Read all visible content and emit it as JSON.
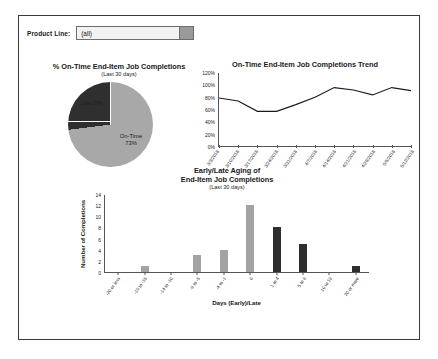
{
  "filter": {
    "label": "Product Line:",
    "value": "(all)",
    "arrow_icon": "dropdown-arrow-icon"
  },
  "pie": {
    "title": "% On-Time End-Item Job Completions",
    "subtitle": "(Last 30 days)",
    "ontime_label_line1": "On-Time",
    "ontime_label_line2": "73%",
    "late_label": "Late 27%"
  },
  "trend": {
    "title": "On-Time End-Item Job Completions Trend"
  },
  "aging": {
    "title_line1": "Early/Late Aging of",
    "title_line2": "End-Item Job Completions",
    "subtitle": "(Last 30 days)",
    "ylabel": "Number of Completions",
    "xlabel": "Days (Early)/Late"
  },
  "colors": {
    "pie_ontime": "#a8a8a8",
    "pie_late": "#2f2f2f",
    "bar_early": "#a3a3a3",
    "bar_late": "#2e2e2e",
    "line": "#1a1a1a",
    "axis": "#555555",
    "frame": "#3a3a3a"
  },
  "chart_data": [
    {
      "type": "pie",
      "title": "% On-Time End-Item Job Completions",
      "subtitle": "(Last 30 days)",
      "labels": [
        "On-Time",
        "Late"
      ],
      "values": [
        73,
        27
      ],
      "data_labels": [
        "On-Time 73%",
        "Late 27%"
      ],
      "colors": [
        "#a8a8a8",
        "#2f2f2f"
      ],
      "legend": "none",
      "start_angle_deg": 0
    },
    {
      "type": "line",
      "title": "On-Time End-Item Job Completions Trend",
      "xlabel": "",
      "ylabel": "",
      "x": [
        "3/3/2018",
        "3/10/2018",
        "3/17/2018",
        "3/24/2018",
        "3/31/2018",
        "4/7/2018",
        "4/14/2018",
        "4/21/2018",
        "4/28/2018",
        "5/5/2018",
        "5/12/2018"
      ],
      "values": [
        79,
        74,
        57,
        57,
        68,
        80,
        96,
        92,
        84,
        96,
        91
      ],
      "unit": "%",
      "ylim": [
        0,
        120
      ],
      "yticks": [
        0,
        20,
        40,
        60,
        80,
        100,
        120
      ],
      "ytick_labels": [
        "0%",
        "20%",
        "40%",
        "60%",
        "80%",
        "100%",
        "120%"
      ],
      "grid": false,
      "legend": "none",
      "series_color": "#1a1a1a"
    },
    {
      "type": "bar",
      "title": "Early/Late Aging of End-Item Job Completions",
      "subtitle": "(Last 30 days)",
      "xlabel": "Days (Early)/Late",
      "ylabel": "Number of Completions",
      "categories": [
        "-20 or less",
        "-19 to -15",
        "-14 to -10",
        "-9 to -5",
        "-4 to -1",
        "0",
        "1 to 4",
        "5 to 9",
        "10 to 19",
        "20 or more"
      ],
      "values": [
        0,
        1,
        0,
        3,
        4,
        12,
        8,
        5,
        0,
        1
      ],
      "bar_colors": [
        "#a3a3a3",
        "#a3a3a3",
        "#a3a3a3",
        "#a3a3a3",
        "#a3a3a3",
        "#a3a3a3",
        "#2e2e2e",
        "#2e2e2e",
        "#2e2e2e",
        "#2e2e2e"
      ],
      "ylim": [
        0,
        14
      ],
      "yticks": [
        0,
        2,
        4,
        6,
        8,
        10,
        12,
        14
      ],
      "ytick_labels": [
        "0",
        "2",
        "4",
        "6",
        "8",
        "10",
        "12",
        "14"
      ],
      "grid": false,
      "legend": "none"
    }
  ]
}
